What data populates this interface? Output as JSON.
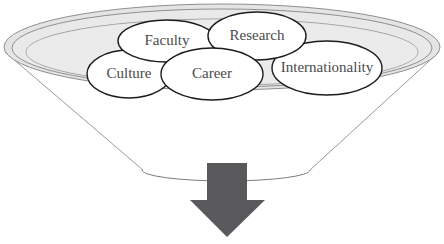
{
  "diagram": {
    "title": "",
    "type": "funnel-with-bubbles",
    "colors": {
      "background": "#ffffff",
      "funnel_rim_fill": "#e2e2e2",
      "funnel_rim_fill_inner": "#ededed",
      "funnel_outline": "#8c8c8c",
      "funnel_outline_dark": "#6e6e6e",
      "bubble_fill": "#ffffff",
      "bubble_outline": "#1a1a1a",
      "bubble_text": "#4a4a4a",
      "arrow_fill": "#59595b"
    },
    "funnel": {
      "name": "funnel-shape",
      "outer_rim": {
        "cx": 222,
        "cy": 47,
        "rx": 218,
        "ry": 43
      },
      "inner_rim": {
        "cx": 222,
        "cy": 50,
        "rx": 205,
        "ry": 36
      },
      "bottom_ellipse": {
        "cx": 226,
        "cy": 170,
        "rx": 84,
        "ry": 11
      }
    },
    "bubbles": [
      {
        "id": "faculty",
        "label": "Faculty",
        "cx": 167,
        "cy": 41,
        "rx": 49,
        "ry": 21,
        "font_size": 15
      },
      {
        "id": "research",
        "label": "Research",
        "cx": 257,
        "cy": 36,
        "rx": 49,
        "ry": 24,
        "font_size": 15
      },
      {
        "id": "internationality",
        "label": "Internationality",
        "cx": 327,
        "cy": 68,
        "rx": 55,
        "ry": 27,
        "font_size": 15
      },
      {
        "id": "culture",
        "label": "Culture",
        "cx": 129,
        "cy": 74,
        "rx": 42,
        "ry": 24,
        "font_size": 15
      },
      {
        "id": "career",
        "label": "Career",
        "cx": 212,
        "cy": 74,
        "rx": 51,
        "ry": 26,
        "font_size": 15
      }
    ],
    "arrow": {
      "name": "down-arrow",
      "direction": "down",
      "shaft": {
        "x": 207,
        "y": 163,
        "width": 40,
        "height": 38
      },
      "head": {
        "left": 190,
        "right": 265,
        "top": 200,
        "tip_x": 227,
        "tip_y": 237
      }
    }
  }
}
